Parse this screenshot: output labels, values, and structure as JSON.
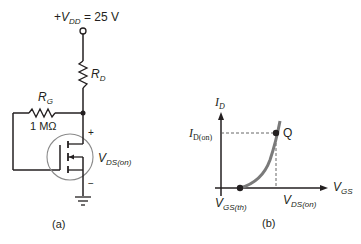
{
  "figure_a": {
    "supply_label_prefix": "+",
    "supply_V": "V",
    "supply_sub": "DD",
    "supply_value": " = 25 V",
    "rd_label_R": "R",
    "rd_label_sub": "D",
    "rg_label_R": "R",
    "rg_label_sub": "G",
    "rg_value": "1 MΩ",
    "plus_sign": "+",
    "minus_sign": "−",
    "vds_V": "V",
    "vds_sub": "DS(on)",
    "caption": "(a)"
  },
  "figure_b": {
    "y_axis_I": "I",
    "y_axis_sub": "D",
    "id_on_I": "I",
    "id_on_sub": "D(on)",
    "q_label": "Q",
    "x_axis_V": "V",
    "x_axis_sub": "GS",
    "vgs_th_V": "V",
    "vgs_th_sub": "GS(th)",
    "vds_on_V": "V",
    "vds_on_sub": "DS(on)",
    "caption": "(b)"
  },
  "colors": {
    "wire": "#231f20",
    "mosfet_circle": "#8a8a8a",
    "curve": "#7a7a7a",
    "dashed": "#555555"
  }
}
